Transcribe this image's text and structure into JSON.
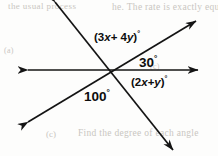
{
  "figure": {
    "width": 218,
    "height": 156,
    "background_color": "#fdfdfc",
    "stroke_color": "#141414",
    "text_color": "#0d0d0d"
  },
  "geometry": {
    "intersection": {
      "x": 113,
      "y": 70
    },
    "lines": [
      {
        "name": "horizontal-line",
        "from": {
          "x": 28,
          "y": 70
        },
        "to": {
          "x": 198,
          "y": 70
        },
        "arrow_start": true,
        "arrow_end": true
      },
      {
        "name": "rising-diagonal-line",
        "from": {
          "x": 28,
          "y": 122
        },
        "to": {
          "x": 196,
          "y": 21
        },
        "arrow_start": true,
        "arrow_end": true
      },
      {
        "name": "steep-falling-line",
        "from": {
          "x": 55,
          "y": 2
        },
        "to": {
          "x": 173,
          "y": 150
        },
        "arrow_start": true,
        "arrow_end": true
      }
    ]
  },
  "labels": {
    "upper_left_angle": {
      "prefix": "(3",
      "var1": "x",
      "middle": "+ 4",
      "var2": "y",
      "suffix": ")",
      "degree": "°"
    },
    "upper_right_angle": {
      "value": "30",
      "degree": "°"
    },
    "lower_right_angle": {
      "prefix": "(2",
      "var1": "x",
      "middle": "+",
      "var2": "y",
      "suffix": ")",
      "degree": "°"
    },
    "lower_left_angle": {
      "value": "100",
      "degree": "°"
    }
  },
  "background_text": {
    "top_left": "the usual process",
    "top_right": "he. The rate is exactly equal",
    "mid_left": "(a)",
    "mid_right": "(c)",
    "bottom_left": "(c)",
    "bottom": "Find the degree of each angle"
  }
}
